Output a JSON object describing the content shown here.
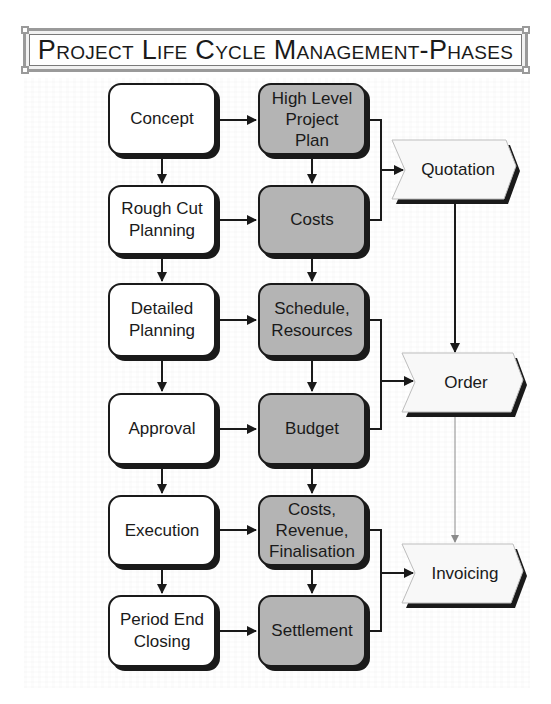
{
  "title": "Project Life Cycle Management-Phases",
  "phases": [
    {
      "label": "Concept"
    },
    {
      "label": "Rough Cut\nPlanning"
    },
    {
      "label": "Detailed\nPlanning"
    },
    {
      "label": "Approval"
    },
    {
      "label": "Execution"
    },
    {
      "label": "Period End\nClosing"
    }
  ],
  "outputs": [
    {
      "label": "High Level\nProject\nPlan"
    },
    {
      "label": "Costs"
    },
    {
      "label": "Schedule,\nResources"
    },
    {
      "label": "Budget"
    },
    {
      "label": "Costs,\nRevenue,\nFinalisation"
    },
    {
      "label": "Settlement"
    }
  ],
  "documents": [
    {
      "label": "Quotation"
    },
    {
      "label": "Order"
    },
    {
      "label": "Invoicing"
    }
  ],
  "colors": {
    "phase_fill": "#ffffff",
    "output_fill": "#b4b4b4",
    "document_fill": "#f8f8f8",
    "stroke": "#1a1a1a",
    "order_to_invoicing_line": "#8a8a8a"
  }
}
